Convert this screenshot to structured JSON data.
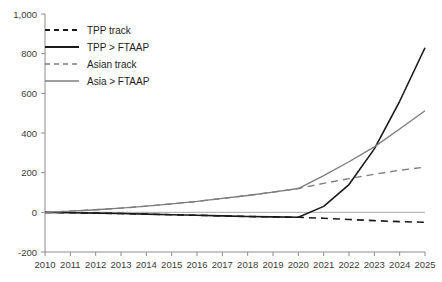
{
  "chart_data": {
    "type": "line",
    "title": "",
    "subtitle": "",
    "xlabel": "",
    "ylabel": "",
    "x": [
      2010,
      2011,
      2012,
      2013,
      2014,
      2015,
      2016,
      2017,
      2018,
      2019,
      2020,
      2021,
      2022,
      2023,
      2024,
      2025
    ],
    "xlim": [
      2010,
      2025
    ],
    "ylim": [
      -200,
      1000
    ],
    "yticks": [
      -200,
      0,
      200,
      400,
      600,
      800,
      1000
    ],
    "ytick_labels": [
      "-200",
      "0",
      "200",
      "400",
      "600",
      "800",
      "1,000"
    ],
    "xtick_labels": [
      "2010",
      "2011",
      "2012",
      "2013",
      "2014",
      "2015",
      "2016",
      "2017",
      "2018",
      "2019",
      "2020",
      "2021",
      "2022",
      "2023",
      "2024",
      "2025"
    ],
    "grid": false,
    "legend_position": "top-left",
    "series": [
      {
        "name": "TPP track",
        "style": "dashed",
        "color": "#1a1a1a",
        "x": [
          2010,
          2011,
          2012,
          2013,
          2014,
          2015,
          2016,
          2017,
          2018,
          2019,
          2020,
          2021,
          2022,
          2023,
          2024,
          2025
        ],
        "values": [
          0,
          -2,
          -4,
          -6,
          -9,
          -12,
          -15,
          -18,
          -21,
          -23,
          -25,
          -30,
          -36,
          -42,
          -47,
          -50
        ]
      },
      {
        "name": "TPP > FTAAP",
        "style": "solid",
        "color": "#1a1a1a",
        "x": [
          2010,
          2011,
          2012,
          2013,
          2014,
          2015,
          2016,
          2017,
          2018,
          2019,
          2020,
          2021,
          2022,
          2023,
          2024,
          2025
        ],
        "values": [
          0,
          -2,
          -4,
          -6,
          -9,
          -12,
          -15,
          -18,
          -21,
          -23,
          -25,
          30,
          140,
          320,
          560,
          830
        ]
      },
      {
        "name": "Asian track",
        "style": "dashed",
        "color": "#7d7d7d",
        "x": [
          2010,
          2011,
          2012,
          2013,
          2014,
          2015,
          2016,
          2017,
          2018,
          2019,
          2020,
          2021,
          2022,
          2023,
          2024,
          2025
        ],
        "values": [
          0,
          6,
          13,
          21,
          31,
          43,
          55,
          70,
          85,
          102,
          120,
          146,
          170,
          192,
          212,
          228
        ]
      },
      {
        "name": "Asia > FTAAP",
        "style": "solid",
        "color": "#7d7d7d",
        "x": [
          2010,
          2011,
          2012,
          2013,
          2014,
          2015,
          2016,
          2017,
          2018,
          2019,
          2020,
          2021,
          2022,
          2023,
          2024,
          2025
        ],
        "values": [
          0,
          6,
          13,
          21,
          31,
          43,
          55,
          70,
          85,
          102,
          120,
          185,
          255,
          330,
          420,
          512
        ]
      }
    ]
  },
  "legend": {
    "items": [
      {
        "label": "TPP track",
        "color": "#1a1a1a",
        "style": "dashed"
      },
      {
        "label": "TPP > FTAAP",
        "color": "#1a1a1a",
        "style": "solid"
      },
      {
        "label": "Asian track",
        "color": "#7d7d7d",
        "style": "dashed"
      },
      {
        "label": "Asia > FTAAP",
        "color": "#7d7d7d",
        "style": "solid"
      }
    ]
  },
  "axes": {
    "y_tick_labels": [
      "1,000",
      "800",
      "600",
      "400",
      "200",
      "0",
      "-200"
    ],
    "x_tick_labels": [
      "2010",
      "2011",
      "2012",
      "2013",
      "2014",
      "2015",
      "2016",
      "2017",
      "2018",
      "2019",
      "2020",
      "2021",
      "2022",
      "2023",
      "2024",
      "2025"
    ]
  }
}
